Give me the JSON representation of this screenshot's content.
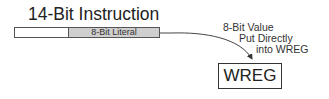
{
  "diagram": {
    "title": "14-Bit Instruction",
    "instruction_fields": [
      {
        "label": "",
        "color": "#ffffff"
      },
      {
        "label": "8-Bit Literal",
        "color": "#cfcfcf"
      }
    ],
    "annotation": {
      "lines": [
        "8-Bit Value",
        "Put Directly",
        "into WREG"
      ]
    },
    "register": {
      "label": "WREG"
    },
    "colors": {
      "line": "#444444",
      "literal_fill": "#cfcfcf"
    }
  }
}
